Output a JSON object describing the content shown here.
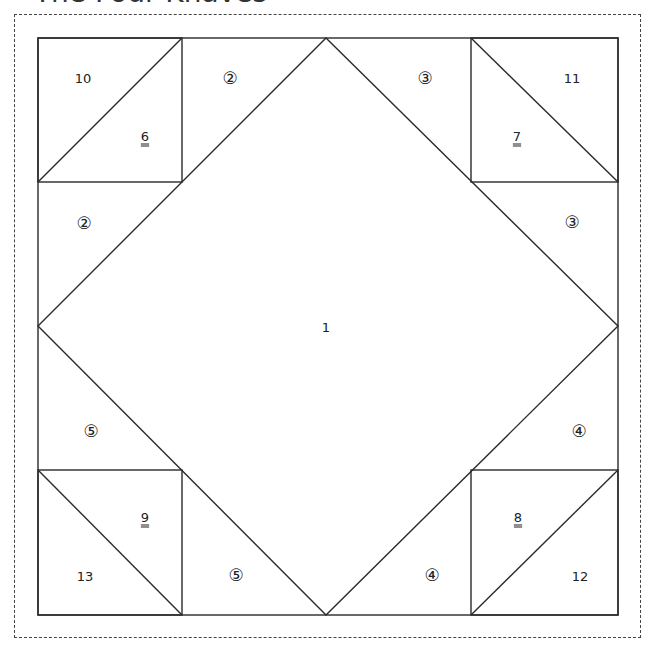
{
  "title": "The Four Knaves",
  "diagram": {
    "pieces": [
      {
        "id": "piece-1",
        "label": "1",
        "style": "plain"
      },
      {
        "id": "piece-2a",
        "label": "②",
        "style": "circled"
      },
      {
        "id": "piece-2b",
        "label": "②",
        "style": "circled"
      },
      {
        "id": "piece-3a",
        "label": "③",
        "style": "circled"
      },
      {
        "id": "piece-3b",
        "label": "③",
        "style": "circled"
      },
      {
        "id": "piece-4a",
        "label": "④",
        "style": "circled"
      },
      {
        "id": "piece-4b",
        "label": "④",
        "style": "circled"
      },
      {
        "id": "piece-5a",
        "label": "⑤",
        "style": "circled"
      },
      {
        "id": "piece-5b",
        "label": "⑤",
        "style": "circled"
      },
      {
        "id": "piece-6",
        "label": "6",
        "style": "double-underline"
      },
      {
        "id": "piece-7",
        "label": "7",
        "style": "double-underline"
      },
      {
        "id": "piece-8",
        "label": "8",
        "style": "double-underline"
      },
      {
        "id": "piece-9",
        "label": "9",
        "style": "double-underline"
      },
      {
        "id": "piece-10",
        "label": "10",
        "style": "plain"
      },
      {
        "id": "piece-11",
        "label": "11",
        "style": "plain"
      },
      {
        "id": "piece-12",
        "label": "12",
        "style": "plain"
      },
      {
        "id": "piece-13",
        "label": "13",
        "style": "plain"
      }
    ]
  }
}
